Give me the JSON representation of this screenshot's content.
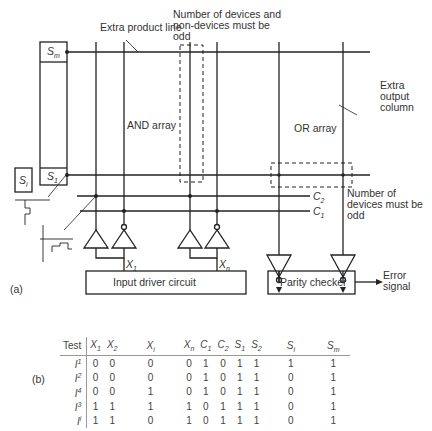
{
  "figure": {
    "part_a_label": "(a)",
    "part_b_label": "(b)"
  },
  "diagram": {
    "labels": {
      "extra_product_line": "Extra product line",
      "number_devices_nondevices": "Number of devices and non-devices must be odd",
      "and_array": "AND array",
      "or_array": "OR array",
      "extra_output_column": "Extra output column",
      "number_devices_odd": "Number of devices must be odd",
      "input_driver_circuit": "Input driver circuit",
      "parity_checker": "Parity checker",
      "error_signal": "Error signal",
      "s_m": "S",
      "s_m_sub": "m",
      "s_1": "S",
      "s_1_sub": "1",
      "s_i": "S",
      "s_i_sub": "i",
      "c_2": "C",
      "c_2_sub": "2",
      "c_1": "C",
      "c_1_sub": "1",
      "x_1": "X",
      "x_1_sub": "1",
      "x_n": "X",
      "x_n_sub": "n"
    }
  },
  "table": {
    "headers": [
      {
        "main": "Test",
        "sub": ""
      },
      {
        "main": "X",
        "sub": "1"
      },
      {
        "main": "X",
        "sub": "2"
      },
      {
        "main": "X",
        "sub": "i"
      },
      {
        "main": "X",
        "sub": "n"
      },
      {
        "main": "C",
        "sub": "1"
      },
      {
        "main": "C",
        "sub": "2"
      },
      {
        "main": "S",
        "sub": "1"
      },
      {
        "main": "S",
        "sub": "2"
      },
      {
        "main": "S",
        "sub": "i"
      },
      {
        "main": "S",
        "sub": "m"
      }
    ],
    "rows": [
      {
        "test": "I",
        "test_sup": "1",
        "values": [
          "0",
          "0",
          "0",
          "0",
          "1",
          "0",
          "1",
          "1",
          "1",
          "1"
        ]
      },
      {
        "test": "I",
        "test_sup": "2",
        "values": [
          "0",
          "0",
          "0",
          "0",
          "1",
          "0",
          "1",
          "1",
          "0",
          "1"
        ]
      },
      {
        "test": "I",
        "test_sup": "4",
        "values": [
          "0",
          "0",
          "1",
          "0",
          "1",
          "0",
          "1",
          "1",
          "0",
          "1"
        ]
      },
      {
        "test": "I",
        "test_sup": "3",
        "values": [
          "1",
          "1",
          "1",
          "1",
          "0",
          "1",
          "1",
          "1",
          "0",
          "1"
        ]
      },
      {
        "test": "I",
        "test_sup": "i",
        "values": [
          "1",
          "1",
          "0",
          "1",
          "0",
          "1",
          "1",
          "1",
          "0",
          "1"
        ]
      }
    ]
  }
}
